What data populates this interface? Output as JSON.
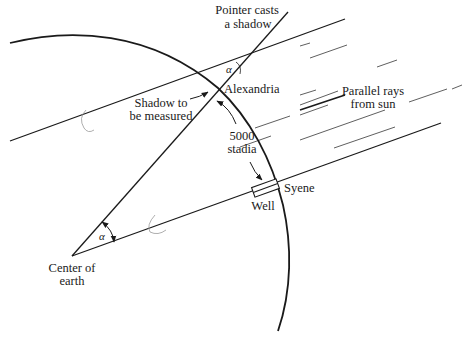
{
  "diagram": {
    "type": "geometry-illustration",
    "labels": {
      "pointer_line1": "Pointer casts",
      "pointer_line2": "a shadow",
      "alexandria": "Alexandria",
      "shadow_line1": "Shadow to",
      "shadow_line2": "be measured",
      "parallel_line1": "Parallel rays",
      "parallel_line2": "from sun",
      "distance_line1": "5000",
      "distance_line2": "stadia",
      "syene": "Syene",
      "well": "Well",
      "center_line1": "Center of",
      "center_line2": "earth",
      "alpha_top": "α",
      "alpha_center": "α"
    },
    "colors": {
      "ink": "#1a1a1a",
      "faint": "#9a9a9a",
      "background": "#ffffff"
    }
  }
}
